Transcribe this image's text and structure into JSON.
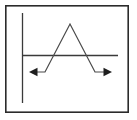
{
  "figure": {
    "background_color": "#ffffff",
    "border_color": "#2b2b2b",
    "axis_color": "#3a3a3a",
    "curve_color": "#4a4a4a",
    "arrow_color": "#1e1e1e",
    "border": {
      "label": "figure-frame",
      "x": 5,
      "y": 5,
      "width": 124,
      "height": 108
    },
    "axes": {
      "x_axis": {
        "label": "x-axis",
        "x1": 22,
        "y1": 55,
        "x2": 118,
        "y2": 55
      },
      "y_axis": {
        "label": "y-axis",
        "x1": 22,
        "y1": 13,
        "x2": 22,
        "y2": 103
      },
      "origin_x": 22,
      "origin_y": 55
    },
    "left_arrow": {
      "label": "left-direction-arrow",
      "direction": "left",
      "tip_x": 29,
      "tip_y": 72,
      "size": 7
    },
    "right_arrow": {
      "label": "right-direction-arrow",
      "direction": "right",
      "tip_x": 112,
      "tip_y": 72,
      "size": 7
    }
  },
  "chart_data": {
    "type": "line",
    "xlabel": "x",
    "ylabel": "y",
    "grid": false,
    "legend": null,
    "axis_origin_pixel": [
      22,
      55
    ],
    "xlim_pixel": [
      22,
      118
    ],
    "ylim_pixel": [
      13,
      103
    ],
    "series": [
      {
        "name": "f(x)",
        "description": "Constant negative tail, rising linear segment to a positive peak, falling linear segment, constant negative tail",
        "points_pixel": [
          [
            29,
            72
          ],
          [
            45,
            72
          ],
          [
            70,
            24
          ],
          [
            95,
            72
          ],
          [
            112,
            72
          ]
        ],
        "segments": [
          {
            "kind": "horizontal-tail-left",
            "from_pixel": [
              29,
              72
            ],
            "to_pixel": [
              45,
              72
            ]
          },
          {
            "kind": "rising-line",
            "from_pixel": [
              45,
              72
            ],
            "to_pixel": [
              70,
              24
            ]
          },
          {
            "kind": "falling-line",
            "from_pixel": [
              70,
              24
            ],
            "to_pixel": [
              95,
              72
            ]
          },
          {
            "kind": "horizontal-tail-right",
            "from_pixel": [
              95,
              72
            ],
            "to_pixel": [
              112,
              72
            ]
          }
        ],
        "peak_pixel": [
          70,
          24
        ],
        "baseline_pixel_y": 72,
        "arrow_start": true,
        "arrow_end": true
      }
    ]
  }
}
